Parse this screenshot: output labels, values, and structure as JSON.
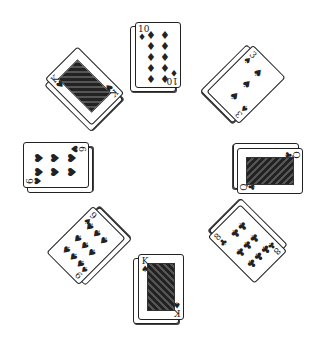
{
  "scene": {
    "title": "Card piles arranged in a circle",
    "background": "#ffffff",
    "ink": "#222222"
  },
  "piles": [
    {
      "id": "top",
      "rank": "10",
      "suit": "♦",
      "suit_name": "diamonds",
      "x": 135,
      "y": 22,
      "rotate": 0,
      "face": false,
      "pip_cols": 2,
      "pip_count": 10
    },
    {
      "id": "top-right",
      "rank": "3",
      "suit": "♠",
      "suit_name": "spades",
      "x": 222,
      "y": 52,
      "rotate": 45,
      "face": false,
      "pip_cols": 1,
      "pip_count": 3
    },
    {
      "id": "right",
      "rank": "Q",
      "suit": "♣",
      "suit_name": "clubs",
      "x": 245,
      "y": 138,
      "rotate": 90,
      "face": true
    },
    {
      "id": "bottom-right",
      "rank": "8",
      "suit": "♣",
      "suit_name": "clubs",
      "x": 222,
      "y": 210,
      "rotate": 135,
      "face": false,
      "pip_cols": 3,
      "pip_count": 8
    },
    {
      "id": "bottom",
      "rank": "K",
      "suit": "♠",
      "suit_name": "spades",
      "x": 138,
      "y": 254,
      "rotate": 0,
      "face": true
    },
    {
      "id": "bottom-left",
      "rank": "9",
      "suit": "♠",
      "suit_name": "spades",
      "x": 62,
      "y": 210,
      "rotate": -135,
      "face": false,
      "pip_cols": 3,
      "pip_count": 9
    },
    {
      "id": "left",
      "rank": "6",
      "suit": "♥",
      "suit_name": "hearts",
      "x": 33,
      "y": 130,
      "rotate": -90,
      "face": false,
      "pip_cols": 2,
      "pip_count": 6
    },
    {
      "id": "top-left",
      "rank": "K",
      "suit": "♥",
      "suit_name": "hearts",
      "x": 62,
      "y": 52,
      "rotate": -45,
      "face": true
    }
  ]
}
